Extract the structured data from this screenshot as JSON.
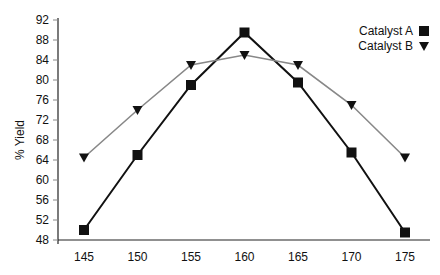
{
  "chart_data": {
    "type": "line",
    "title": "",
    "xlabel": "",
    "ylabel": "% Yield",
    "x": [
      145,
      150,
      155,
      160,
      165,
      170,
      175
    ],
    "x_ticks": [
      "145",
      "150",
      "155",
      "160",
      "165",
      "170",
      "175"
    ],
    "y_ticks": [
      "48",
      "52",
      "56",
      "60",
      "64",
      "68",
      "72",
      "76",
      "80",
      "84",
      "88",
      "92"
    ],
    "ylim": [
      48,
      92
    ],
    "grid": false,
    "legend_position": "top-right",
    "series": [
      {
        "name": "Catalyst A",
        "marker": "square",
        "color": "#111111",
        "values": [
          50,
          65,
          79,
          89.5,
          79.5,
          65.5,
          49.5
        ]
      },
      {
        "name": "Catalyst B",
        "marker": "triangle-down",
        "color": "#888888",
        "marker_color": "#111111",
        "values": [
          64.5,
          74,
          83,
          85,
          83,
          75,
          64.5
        ]
      }
    ]
  },
  "legend": {
    "items": [
      {
        "label": "Catalyst A",
        "symbol": "black-square"
      },
      {
        "label": "Catalyst B",
        "symbol": "black-down-triangle"
      }
    ]
  }
}
